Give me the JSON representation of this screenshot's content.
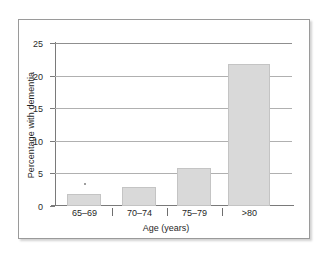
{
  "chart_data": {
    "type": "bar",
    "title": "",
    "xlabel": "Age (years)",
    "ylabel": "Percentage with dementia",
    "categories": [
      "65–69",
      "70–74",
      "75–79",
      ">80"
    ],
    "values": [
      1.9,
      2.9,
      5.8,
      21.8
    ],
    "series": [
      {
        "name": "Percentage with dementia",
        "values": [
          1.9,
          2.9,
          5.8,
          21.8
        ]
      }
    ],
    "ylim": [
      0,
      25
    ],
    "yticks": [
      0,
      5,
      10,
      15,
      20,
      25
    ],
    "ytick_labels": [
      "0",
      "5",
      "10",
      "15",
      "20",
      "25"
    ],
    "grid": true,
    "grid_axis": "y",
    "legend": false,
    "legend_position": "none",
    "bar_color": "#d9d9d9",
    "bar_edge_color": "#c4c4c4",
    "gridline_color": "#b0b0b0",
    "axis_color": "#7a7a7a",
    "frame_border_color": "#9a9a9a",
    "background_color": "#ffffff",
    "text_color": "#1f1f1f"
  },
  "axes": {
    "y_title": "Percentage with dementia",
    "x_title": "Age (years)",
    "y_ticks": [
      {
        "label": "25",
        "value": 25
      },
      {
        "label": "20",
        "value": 20
      },
      {
        "label": "15",
        "value": 15
      },
      {
        "label": "10",
        "value": 10
      },
      {
        "label": "5",
        "value": 5
      },
      {
        "label": "0",
        "value": 0
      }
    ],
    "x_ticks": [
      {
        "label": "65–69"
      },
      {
        "label": "70–74"
      },
      {
        "label": "75–79"
      },
      {
        "label": ">80"
      }
    ]
  }
}
